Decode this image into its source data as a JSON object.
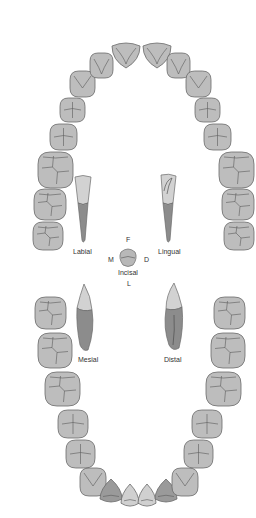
{
  "colors": {
    "background": "#ffffff",
    "tooth_fill": "#bdbdbd",
    "tooth_stroke": "#6a6a6a",
    "groove_stroke": "#5a5a5a",
    "lower_lateral_fill": "#9a9a9a",
    "root_fill": "#8a8a8a",
    "crown_light": "#d0d0d0",
    "label_color": "#333333"
  },
  "labels": {
    "labial": "Labial",
    "lingual": "Lingual",
    "mesial": "Mesial",
    "distal": "Distal",
    "facial_f": "F",
    "mesial_m": "M",
    "distal_d": "D",
    "incisal": "Incisal",
    "lingual_l": "L"
  },
  "upper_arch": {
    "teeth": [
      {
        "name": "upper-right-third-molar",
        "x": 33,
        "y": 222,
        "w": 30,
        "h": 28,
        "type": "molar"
      },
      {
        "name": "upper-right-second-molar",
        "x": 34,
        "y": 189,
        "w": 32,
        "h": 31,
        "type": "molar"
      },
      {
        "name": "upper-right-first-molar",
        "x": 38,
        "y": 152,
        "w": 35,
        "h": 36,
        "type": "molar"
      },
      {
        "name": "upper-right-second-premolar",
        "x": 50,
        "y": 124,
        "w": 27,
        "h": 26,
        "type": "premolar"
      },
      {
        "name": "upper-right-first-premolar",
        "x": 60,
        "y": 98,
        "w": 25,
        "h": 24,
        "type": "premolar"
      },
      {
        "name": "upper-right-canine",
        "x": 70,
        "y": 71,
        "w": 25,
        "h": 26,
        "type": "canine"
      },
      {
        "name": "upper-right-lateral-incisor",
        "x": 90,
        "y": 53,
        "w": 23,
        "h": 25,
        "type": "incisor"
      },
      {
        "name": "upper-right-central-incisor",
        "x": 112,
        "y": 42,
        "w": 28,
        "h": 26,
        "type": "central"
      },
      {
        "name": "upper-left-central-incisor",
        "x": 143,
        "y": 42,
        "w": 28,
        "h": 26,
        "type": "central"
      },
      {
        "name": "upper-left-lateral-incisor",
        "x": 167,
        "y": 53,
        "w": 23,
        "h": 25,
        "type": "incisor"
      },
      {
        "name": "upper-left-canine",
        "x": 186,
        "y": 71,
        "w": 25,
        "h": 26,
        "type": "canine"
      },
      {
        "name": "upper-left-first-premolar",
        "x": 195,
        "y": 98,
        "w": 25,
        "h": 24,
        "type": "premolar"
      },
      {
        "name": "upper-left-second-premolar",
        "x": 204,
        "y": 124,
        "w": 27,
        "h": 26,
        "type": "premolar"
      },
      {
        "name": "upper-left-first-molar",
        "x": 219,
        "y": 152,
        "w": 35,
        "h": 36,
        "type": "molar"
      },
      {
        "name": "upper-left-second-molar",
        "x": 222,
        "y": 189,
        "w": 32,
        "h": 31,
        "type": "molar"
      },
      {
        "name": "upper-left-third-molar",
        "x": 224,
        "y": 222,
        "w": 30,
        "h": 28,
        "type": "molar"
      }
    ]
  },
  "lower_arch": {
    "teeth": [
      {
        "name": "lower-right-third-molar",
        "x": 35,
        "y": 297,
        "w": 31,
        "h": 32,
        "type": "molar"
      },
      {
        "name": "lower-right-second-molar",
        "x": 38,
        "y": 333,
        "w": 34,
        "h": 35,
        "type": "molar"
      },
      {
        "name": "lower-right-first-molar",
        "x": 45,
        "y": 372,
        "w": 35,
        "h": 34,
        "type": "molar"
      },
      {
        "name": "lower-right-second-premolar",
        "x": 58,
        "y": 410,
        "w": 30,
        "h": 28,
        "type": "premolar"
      },
      {
        "name": "lower-right-first-premolar",
        "x": 66,
        "y": 440,
        "w": 29,
        "h": 28,
        "type": "premolar"
      },
      {
        "name": "lower-right-canine",
        "x": 80,
        "y": 468,
        "w": 26,
        "h": 28,
        "type": "lcanine"
      },
      {
        "name": "lower-right-lateral-incisor",
        "x": 100,
        "y": 479,
        "w": 22,
        "h": 25,
        "type": "llateral"
      },
      {
        "name": "lower-right-central-incisor",
        "x": 121,
        "y": 484,
        "w": 18,
        "h": 24,
        "type": "lcentral"
      },
      {
        "name": "lower-left-central-incisor",
        "x": 138,
        "y": 484,
        "w": 18,
        "h": 24,
        "type": "lcentral"
      },
      {
        "name": "lower-left-lateral-incisor",
        "x": 155,
        "y": 479,
        "w": 22,
        "h": 25,
        "type": "llateral"
      },
      {
        "name": "lower-left-canine",
        "x": 172,
        "y": 468,
        "w": 26,
        "h": 28,
        "type": "lcanine"
      },
      {
        "name": "lower-left-first-premolar",
        "x": 184,
        "y": 440,
        "w": 29,
        "h": 28,
        "type": "premolar"
      },
      {
        "name": "lower-left-second-premolar",
        "x": 192,
        "y": 410,
        "w": 30,
        "h": 28,
        "type": "premolar"
      },
      {
        "name": "lower-left-first-molar",
        "x": 206,
        "y": 372,
        "w": 35,
        "h": 34,
        "type": "molar"
      },
      {
        "name": "lower-left-second-molar",
        "x": 211,
        "y": 333,
        "w": 34,
        "h": 35,
        "type": "molar"
      },
      {
        "name": "lower-left-third-molar",
        "x": 214,
        "y": 297,
        "w": 31,
        "h": 32,
        "type": "molar"
      }
    ]
  }
}
